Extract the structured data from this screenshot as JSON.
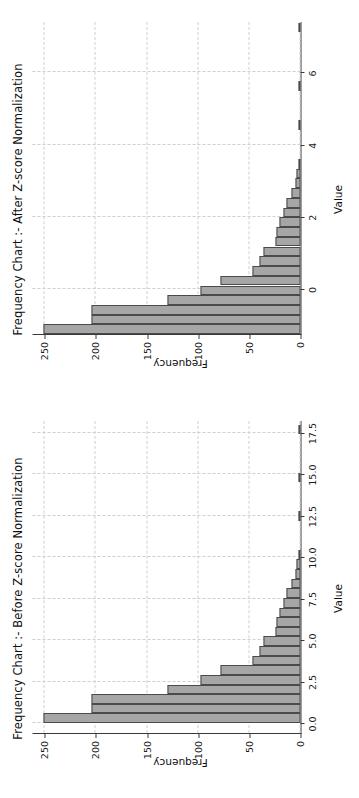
{
  "figure": {
    "background": "#ffffff",
    "bar_fill": "#a6a6a6",
    "bar_edge": "#4a4a4a",
    "grid_color": "#cfcfcf",
    "axis_color": "#3a3a3a",
    "orientation": "rotated-90-ccw"
  },
  "chart_data": [
    {
      "id": "before",
      "type": "bar",
      "title": "Frequency Chart :- Before Z-score Normalization",
      "xlabel": "Value",
      "ylabel": "Frequency",
      "xlim": [
        -0.6,
        18.2
      ],
      "ylim": [
        0,
        262
      ],
      "xticks": [
        0.0,
        2.5,
        5.0,
        7.5,
        10.0,
        12.5,
        15.0,
        17.5
      ],
      "xticklabels": [
        "0.0",
        "2.5",
        "5.0",
        "7.5",
        "10.0",
        "12.5",
        "15.0",
        "17.5"
      ],
      "yticks": [
        0,
        50,
        100,
        150,
        200,
        250
      ],
      "yticklabels": [
        "0",
        "50",
        "100",
        "150",
        "200",
        "250"
      ],
      "grid": true,
      "grid_style": "dashed",
      "legend": null,
      "bin_width": 0.58,
      "bin_centers": [
        0.29,
        0.87,
        1.45,
        2.03,
        2.61,
        3.19,
        3.77,
        4.35,
        4.93,
        5.51,
        6.09,
        6.67,
        7.25,
        7.83,
        8.41,
        8.99,
        9.57,
        10.15,
        10.73,
        11.31,
        11.89,
        12.47,
        13.05,
        13.63,
        14.21,
        14.79,
        15.37,
        15.95,
        16.53,
        17.11,
        17.69
      ],
      "values": [
        251,
        204,
        204,
        130,
        98,
        78,
        47,
        40,
        36,
        24,
        23,
        21,
        17,
        14,
        9,
        5,
        4,
        1,
        0,
        0,
        0,
        1,
        0,
        0,
        0,
        1,
        0,
        0,
        0,
        0,
        1
      ]
    },
    {
      "id": "after",
      "type": "bar",
      "title": "Frequency Chart :- After Z-score Normalization",
      "xlabel": "Value",
      "ylabel": "Frequency",
      "xlim": [
        -1.25,
        7.4
      ],
      "ylim": [
        0,
        262
      ],
      "xticks": [
        0,
        2,
        4,
        6
      ],
      "xticklabels": [
        "0",
        "2",
        "4",
        "6"
      ],
      "yticks": [
        0,
        50,
        100,
        150,
        200,
        250
      ],
      "yticklabels": [
        "0",
        "50",
        "100",
        "150",
        "200",
        "250"
      ],
      "grid": true,
      "grid_style": "dashed",
      "legend": null,
      "bin_width": 0.268,
      "bin_centers": [
        -1.12,
        -0.85,
        -0.58,
        -0.31,
        -0.04,
        0.23,
        0.5,
        0.77,
        1.04,
        1.31,
        1.58,
        1.85,
        2.12,
        2.39,
        2.66,
        2.93,
        3.2,
        3.47,
        3.74,
        4.01,
        4.28,
        4.55,
        4.82,
        5.09,
        5.36,
        5.63,
        5.9,
        6.17,
        6.44,
        6.71,
        6.98,
        7.25
      ],
      "values": [
        251,
        204,
        204,
        130,
        98,
        78,
        47,
        40,
        36,
        24,
        23,
        21,
        17,
        14,
        9,
        5,
        4,
        1,
        0,
        0,
        0,
        1,
        0,
        0,
        0,
        1,
        0,
        0,
        0,
        0,
        0,
        1
      ]
    }
  ]
}
